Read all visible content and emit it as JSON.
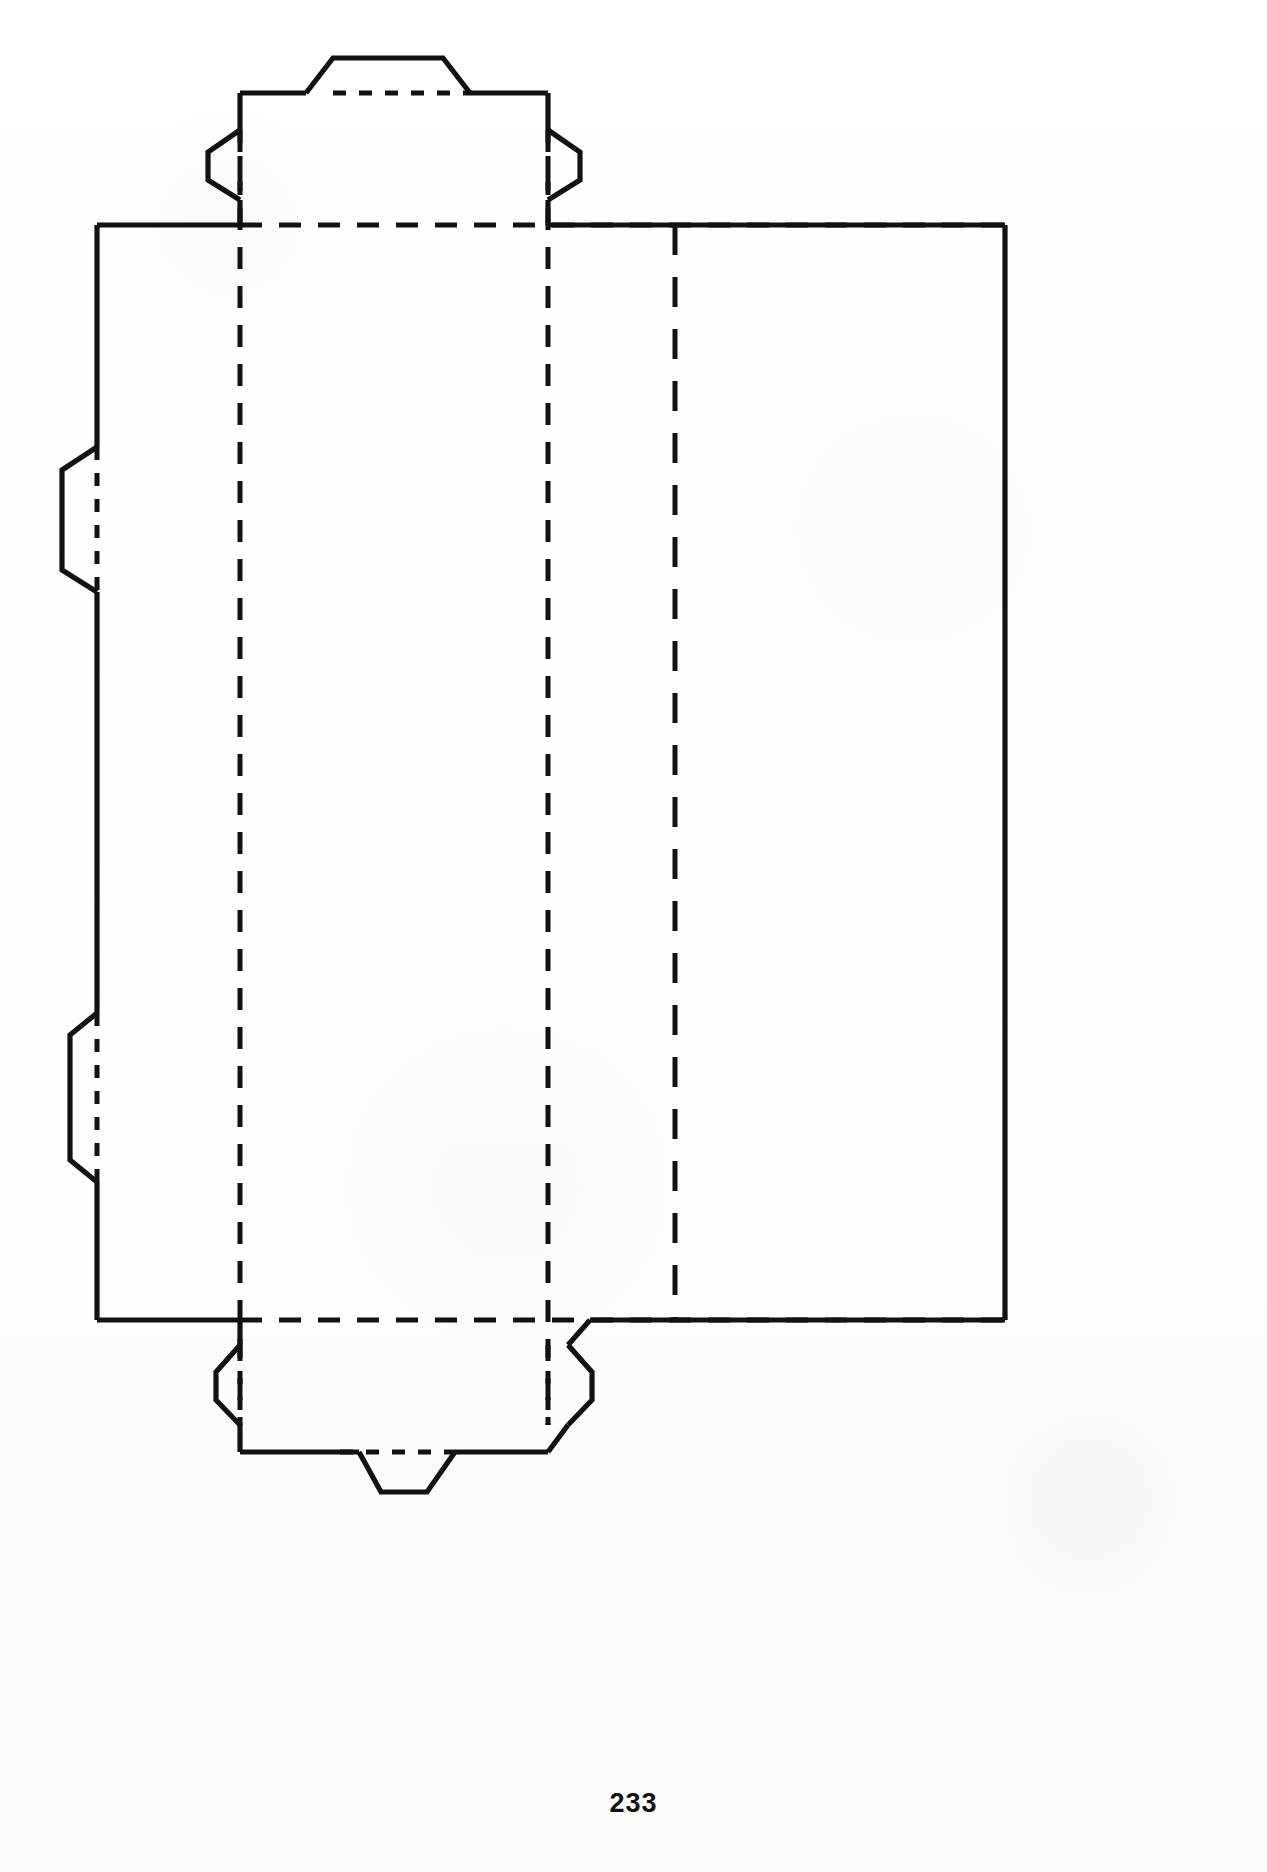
{
  "document": {
    "type": "technical-drawing",
    "subject": "carton dieline / packaging net",
    "page_number": "233",
    "background_color": "#ffffff",
    "ink_color": "#121212"
  },
  "drawing": {
    "title": "",
    "line_styles": {
      "cut_line": "solid",
      "fold_line": "dashed"
    },
    "geometry": {
      "view_box": "0 0 1267 1872",
      "main_panel": {
        "left": 97,
        "right": 1005,
        "top": 225,
        "bottom": 1320
      },
      "vertical_fold_lines_x": [
        240,
        548,
        675
      ],
      "horizontal_fold_lines_y": [
        225,
        1320
      ],
      "center_panel": {
        "left": 240,
        "right": 548
      },
      "top_extension": {
        "top": 93,
        "bottom": 225
      },
      "bottom_extension": {
        "top": 1320,
        "bottom": 1452
      },
      "top_tab": {
        "left": 333,
        "right": 443,
        "apex_y": 58
      },
      "bottom_tab": {
        "left": 359,
        "right": 455,
        "apex_y": 1492
      },
      "left_side_flaps": [
        {
          "top": 447,
          "bottom": 592,
          "outer_x": 62
        },
        {
          "top": 1013,
          "bottom": 1182,
          "outer_x": 70
        }
      ],
      "top_wing_flaps": [
        {
          "side": "left",
          "top": 130,
          "bottom": 200,
          "outer_x": 187
        },
        {
          "side": "right",
          "top": 130,
          "bottom": 200,
          "outer_x": 580
        }
      ],
      "bottom_wing_flaps": [
        {
          "side": "left",
          "top": 1345,
          "bottom": 1425,
          "outer_x": 205
        },
        {
          "side": "right",
          "top": 1345,
          "bottom": 1425,
          "outer_x": 592
        }
      ]
    },
    "paths": {
      "outer_cut": "M 333 58 L 443 58 L 470 93 L 548 93 L 548 130 L 580 152 L 580 180 L 548 200 L 548 225 L 1005 225 L 1005 1320 L 590 1320 L 568 1345 L 592 1372 L 592 1400 L 568 1425 L 548 1452 L 455 1452 L 427 1492 L 359 1492 L 333 1452 L 240 1452 L 240 1425 L 216 1400 L 216 1372 L 240 1345 L 240 1320 L 97 1320 L 97 1182 L 70 1160 L 70 1035 L 97 1013 L 97 592 L 62 570 L 62 470 L 97 447 L 97 225 L 240 225 L 240 200 L 208 180 L 208 152 L 240 130 L 240 93 L 306 93 Z",
      "fold_top_horizontal": "M 240 225 L 1005 225",
      "fold_bottom_horizontal": "M 240 1320 L 1005 1320",
      "fold_vertical_left": "M 240 93 L 240 1452",
      "fold_vertical_center": "M 548 93 L 548 1452",
      "fold_vertical_right": "M 675 225 L 675 1320",
      "fold_top_tab": "M 333 93 L 470 93",
      "fold_bottom_tab": "M 333 1452 L 455 1452",
      "fold_left_flap_a": "M 97 447 L 97 592",
      "fold_left_flap_b": "M 97 1013 L 97 1182"
    }
  },
  "footer": {
    "page_label": "233"
  }
}
